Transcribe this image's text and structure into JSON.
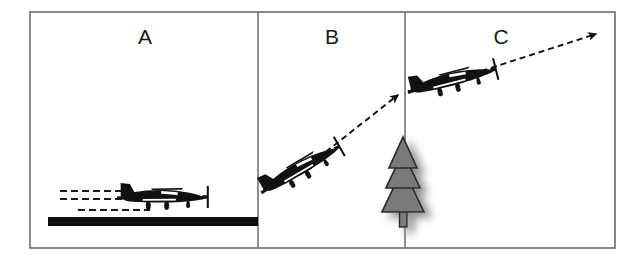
{
  "figure": {
    "frame": {
      "x": 30,
      "y": 12,
      "width": 585,
      "height": 236,
      "stroke_color": "#6b6b6b",
      "stroke_width": 1.6,
      "fill_color": "#ffffff"
    },
    "dividers": [
      {
        "name": "divider-a-b",
        "x": 258,
        "y1": 12,
        "y2": 248,
        "color": "#6b6b6b"
      },
      {
        "name": "divider-b-c",
        "x": 405,
        "y1": 12,
        "y2": 248,
        "color": "#6b6b6b"
      }
    ],
    "panels": [
      {
        "id": "a",
        "label": "A",
        "label_x": 145,
        "label_y": 37,
        "description": "Aircraft accelerating on the runway during takeoff roll"
      },
      {
        "id": "b",
        "label": "B",
        "label_x": 332,
        "label_y": 37,
        "description": "Aircraft in steep initial climb along dashed flight path"
      },
      {
        "id": "c",
        "label": "C",
        "label_x": 501,
        "label_y": 37,
        "description": "Aircraft in shallower climb after clearing the obstacle"
      }
    ],
    "runway": {
      "name": "runway-bar",
      "x": 48,
      "y": 217,
      "width": 210,
      "height": 9,
      "color": "#0d0d0d"
    },
    "speed_lines": [
      {
        "x1": 60,
        "y1": 191,
        "x2": 135,
        "y2": 191
      },
      {
        "x1": 60,
        "y1": 199,
        "x2": 133,
        "y2": 199
      },
      {
        "x1": 78,
        "y1": 210,
        "x2": 150,
        "y2": 210
      }
    ],
    "speed_line_style": {
      "color": "#1a1a1a",
      "width": 2.2,
      "dash": "7 4"
    },
    "aircraft": [
      {
        "name": "aircraft-panel-a",
        "panel": "A",
        "x": 163,
        "y": 196,
        "scale": 0.92,
        "rotation": 0,
        "color": "#111111",
        "state": "ground roll"
      },
      {
        "name": "aircraft-panel-b",
        "panel": "B",
        "x": 300,
        "y": 168,
        "scale": 0.92,
        "rotation": -30,
        "color": "#111111",
        "state": "steep climb"
      },
      {
        "name": "aircraft-panel-c",
        "panel": "C",
        "x": 452,
        "y": 79,
        "scale": 0.92,
        "rotation": -14,
        "color": "#111111",
        "state": "shallow climb"
      }
    ],
    "flight_path_arrows": [
      {
        "name": "flight-path-arrow-b",
        "panel": "B",
        "x1": 318,
        "y1": 158,
        "x2": 400,
        "y2": 93,
        "color": "#111111",
        "width": 1.9,
        "dash": "6 4"
      },
      {
        "name": "flight-path-arrow-c",
        "panel": "C",
        "x1": 472,
        "y1": 74,
        "x2": 598,
        "y2": 33,
        "color": "#111111",
        "width": 1.9,
        "dash": "6 4"
      }
    ],
    "obstacle": {
      "name": "pine-tree-obstacle",
      "x": 403,
      "base_y": 227,
      "top_y": 137,
      "fill_color": "#7a7a7a",
      "stroke_color": "#2b2b2b",
      "shadow_color": "#9a9a9a",
      "tiers": 3,
      "description": "Gray pine tree obstacle at the end of the runway"
    },
    "background_color": "#ffffff"
  }
}
